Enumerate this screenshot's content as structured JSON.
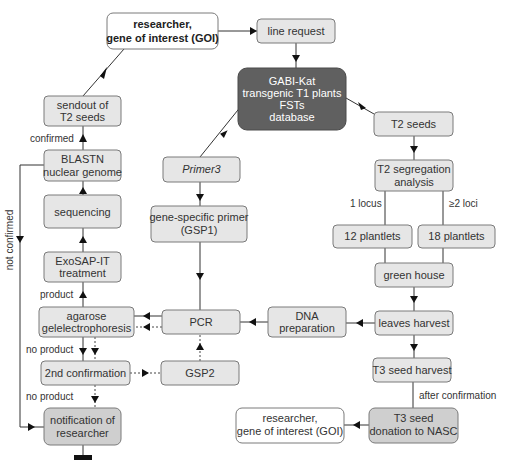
{
  "diagram": {
    "nodes": {
      "researcher_top": {
        "lines": [
          "researcher,",
          "gene of interest (GOI)"
        ],
        "bold_part": "(GOI)"
      },
      "line_request": {
        "lines": [
          "line request"
        ]
      },
      "gabi_kat": {
        "lines": [
          "GABI-Kat",
          "transgenic T1 plants",
          "FSTs",
          "database"
        ]
      },
      "t2_seeds": {
        "lines": [
          "T2 seeds"
        ]
      },
      "sendout": {
        "lines": [
          "sendout of",
          "T2 seeds"
        ]
      },
      "blastn": {
        "lines": [
          "BLASTN",
          "nuclear genome"
        ]
      },
      "primer3": {
        "lines": [
          "Primer3"
        ]
      },
      "sequencing": {
        "lines": [
          "sequencing"
        ]
      },
      "gsp1": {
        "lines": [
          "gene-specific primer",
          "(GSP1)"
        ]
      },
      "exosap": {
        "lines": [
          "ExoSAP-IT",
          "treatment"
        ]
      },
      "t2_segregation": {
        "lines": [
          "T2 segregation",
          "analysis"
        ]
      },
      "plantlets12": {
        "lines": [
          "12 plantlets"
        ]
      },
      "plantlets18": {
        "lines": [
          "18 plantlets"
        ]
      },
      "green_house": {
        "lines": [
          "green house"
        ]
      },
      "agarose": {
        "lines": [
          "agarose",
          "gelelectrophoresis"
        ]
      },
      "pcr": {
        "lines": [
          "PCR"
        ]
      },
      "dna_prep": {
        "lines": [
          "DNA",
          "preparation"
        ]
      },
      "leaves_harvest": {
        "lines": [
          "leaves harvest"
        ]
      },
      "second_confirmation": {
        "lines": [
          "2nd confirmation"
        ]
      },
      "gsp2": {
        "lines": [
          "GSP2"
        ]
      },
      "t3_seed_harvest": {
        "lines": [
          "T3 seed harvest"
        ]
      },
      "notification": {
        "lines": [
          "notification of",
          "researcher"
        ]
      },
      "researcher_bottom": {
        "lines": [
          "researcher,",
          "gene of interest (GOI)"
        ]
      },
      "t3_donation": {
        "lines": [
          "T3 seed",
          "donation to NASC"
        ]
      }
    },
    "edge_labels": {
      "confirmed": "confirmed",
      "not_confirmed": "not confirmed",
      "product": "product",
      "no_product_1": "no product",
      "no_product_2": "no product",
      "one_locus": "1 locus",
      "two_loci": "≥2 loci",
      "after_confirmation": "after confirmation"
    },
    "colors": {
      "box_light": "#e6e6e6",
      "box_mid": "#cfcfcf",
      "box_dark": "#606060",
      "box_white": "#ffffff"
    }
  }
}
